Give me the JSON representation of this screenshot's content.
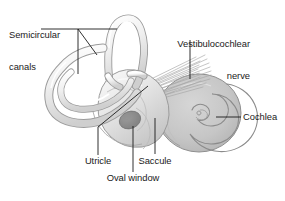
{
  "figure": {
    "background_color": "#ffffff",
    "width": 285,
    "height": 201
  },
  "colors": {
    "background": "#ffffff",
    "text": "#1a1a1a",
    "leader_line": "#1a1a1a",
    "structure_outline": "#9a9a9a",
    "structure_light": "#f2f2f2",
    "structure_mid": "#d9d9d9",
    "cochlea_fill": "#c8c8c8",
    "cochlea_shade": "#b4b4b4",
    "oval_window": "#8a8a8a",
    "nerve_fiber": "#a8a8a8"
  },
  "labels": {
    "semicircular_canals": {
      "line1": "Semicircular",
      "line2": "canals"
    },
    "vestibulocochlear_nerve": {
      "line1": "Vestibulocochlear",
      "line2": "nerve"
    },
    "cochlea": "Cochlea",
    "utricle": "Utricle",
    "saccule": "Saccule",
    "oval_window": "Oval window"
  },
  "structures": [
    {
      "name": "semicircular-canals",
      "label": "Semicircular canals"
    },
    {
      "name": "vestibule",
      "label": "Vestibule"
    },
    {
      "name": "cochlea",
      "label": "Cochlea"
    },
    {
      "name": "vestibulocochlear-nerve",
      "label": "Vestibulocochlear nerve"
    },
    {
      "name": "utricle",
      "label": "Utricle"
    },
    {
      "name": "saccule",
      "label": "Saccule"
    },
    {
      "name": "oval-window",
      "label": "Oval window"
    }
  ]
}
